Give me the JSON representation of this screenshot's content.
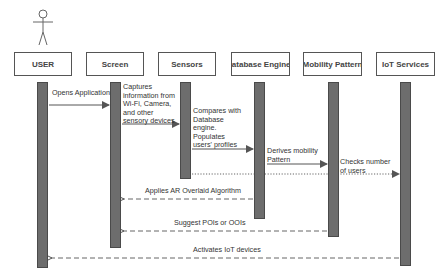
{
  "diagram": {
    "type": "sequence",
    "actor": {
      "name": "stick-figure",
      "label": "USER"
    },
    "lifelines": [
      {
        "id": "user",
        "label": "USER"
      },
      {
        "id": "screen",
        "label": "Screen"
      },
      {
        "id": "sensors",
        "label": "Sensors"
      },
      {
        "id": "db",
        "label": "Database Engines"
      },
      {
        "id": "mobility",
        "label": "Mobility Pattern"
      },
      {
        "id": "iot",
        "label": "IoT Services"
      }
    ],
    "messages": [
      {
        "from": "user",
        "to": "screen",
        "style": "solid",
        "lines": [
          "Opens Application"
        ]
      },
      {
        "from": "screen",
        "to": "sensors",
        "style": "solid",
        "lines": [
          "Captures",
          "information from",
          "Wi-Fi, Camera,",
          "and other",
          "sensory devices"
        ]
      },
      {
        "from": "sensors",
        "to": "db",
        "style": "solid",
        "lines": [
          "Compares with",
          "Database",
          "engine.",
          "Populates",
          "users' profiles"
        ]
      },
      {
        "from": "db",
        "to": "mobility",
        "style": "solid",
        "lines": [
          "Derives mobility",
          "Pattern"
        ]
      },
      {
        "from": "sensors",
        "to": "iot",
        "style": "dotted",
        "lines": [
          "Checks number",
          "of users"
        ]
      },
      {
        "from": "db",
        "to": "screen",
        "style": "dashed",
        "lines": [
          "Applies AR Overlaid Algorithm"
        ]
      },
      {
        "from": "mobility",
        "to": "screen",
        "style": "dashed",
        "lines": [
          "Suggest POIs or OOIs"
        ]
      },
      {
        "from": "iot",
        "to": "user",
        "style": "dashed",
        "lines": [
          "Activates IoT devices"
        ]
      }
    ],
    "colors": {
      "activation": "#6d6d6d",
      "line": "#555555",
      "box_border": "#555555"
    }
  }
}
